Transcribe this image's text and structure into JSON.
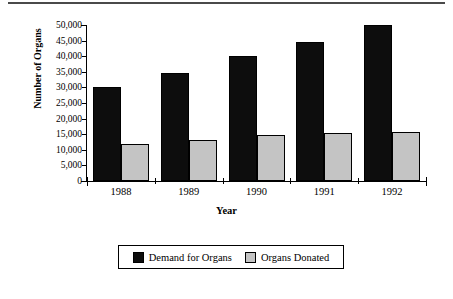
{
  "chart_data": {
    "type": "bar",
    "title": "",
    "xlabel": "Year",
    "ylabel": "Number of Organs",
    "categories": [
      "1988",
      "1989",
      "1990",
      "1991",
      "1992"
    ],
    "series": [
      {
        "name": "Demand for Organs",
        "color": "#0d0d0d",
        "values": [
          30000,
          34500,
          40000,
          44500,
          50000
        ]
      },
      {
        "name": "Organs Donated",
        "color": "#c4c4c4",
        "values": [
          12000,
          13000,
          14800,
          15500,
          15700
        ]
      }
    ],
    "ylim": [
      0,
      50000
    ],
    "ytick_values": [
      0,
      5000,
      10000,
      15000,
      20000,
      25000,
      30000,
      35000,
      40000,
      45000,
      50000
    ],
    "ytick_labels": [
      "0",
      "5,000",
      "10,000",
      "15,000",
      "20,000",
      "25,000",
      "30,000",
      "35,000",
      "40,000",
      "45,000",
      "50,000"
    ],
    "grid": false,
    "legend_position": "bottom"
  },
  "legend": {
    "entries": [
      {
        "label": "Demand for Organs"
      },
      {
        "label": "Organs Donated"
      }
    ]
  }
}
